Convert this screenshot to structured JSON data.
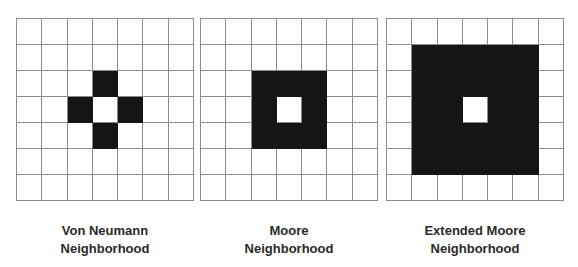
{
  "colors": {
    "filled": "#151515",
    "empty": "#ffffff",
    "gridline": "#8a8a8a",
    "label": "#2a2a2a"
  },
  "panels": [
    {
      "name": "von-neumann",
      "label_line1": "Von Neumann",
      "label_line2": "Neighborhood",
      "rows": 7,
      "cols": 7,
      "filled_cells": [
        [
          2,
          3
        ],
        [
          3,
          2
        ],
        [
          3,
          4
        ],
        [
          4,
          3
        ]
      ],
      "center_cell": [
        3,
        3
      ]
    },
    {
      "name": "moore",
      "label_line1": "Moore",
      "label_line2": "Neighborhood",
      "rows": 7,
      "cols": 7,
      "filled_cells": [
        [
          2,
          2
        ],
        [
          2,
          3
        ],
        [
          2,
          4
        ],
        [
          3,
          2
        ],
        [
          3,
          4
        ],
        [
          4,
          2
        ],
        [
          4,
          3
        ],
        [
          4,
          4
        ]
      ],
      "center_cell": [
        3,
        3
      ]
    },
    {
      "name": "extended-moore",
      "label_line1": "Extended Moore",
      "label_line2": "Neighborhood",
      "rows": 7,
      "cols": 7,
      "filled_cells": [
        [
          1,
          1
        ],
        [
          1,
          2
        ],
        [
          1,
          3
        ],
        [
          1,
          4
        ],
        [
          1,
          5
        ],
        [
          2,
          1
        ],
        [
          2,
          2
        ],
        [
          2,
          3
        ],
        [
          2,
          4
        ],
        [
          2,
          5
        ],
        [
          3,
          1
        ],
        [
          3,
          2
        ],
        [
          3,
          4
        ],
        [
          3,
          5
        ],
        [
          4,
          1
        ],
        [
          4,
          2
        ],
        [
          4,
          3
        ],
        [
          4,
          4
        ],
        [
          4,
          5
        ],
        [
          5,
          1
        ],
        [
          5,
          2
        ],
        [
          5,
          3
        ],
        [
          5,
          4
        ],
        [
          5,
          5
        ]
      ],
      "center_cell": [
        3,
        3
      ]
    }
  ]
}
